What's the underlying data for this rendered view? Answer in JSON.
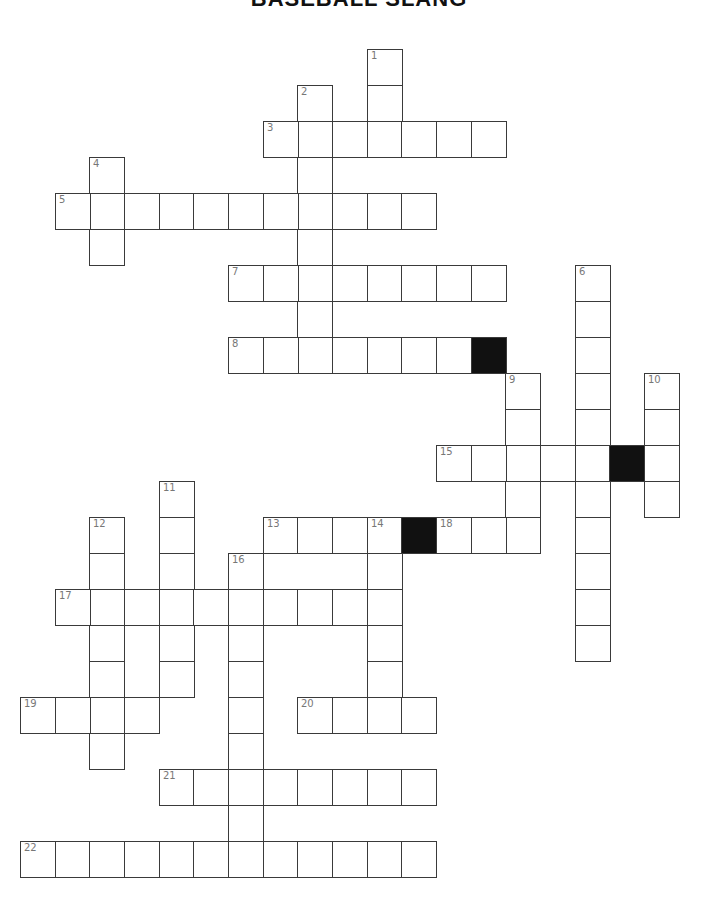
{
  "title": "BASEBALL SLANG",
  "grid": {
    "origin_x": 20,
    "origin_y": 49,
    "cell_w": 34.67,
    "cell_h": 36,
    "entries": [
      {
        "number": "1",
        "direction": "down",
        "col": 10,
        "row": 0,
        "length": 3
      },
      {
        "number": "2",
        "direction": "down",
        "col": 8,
        "row": 1,
        "length": 8
      },
      {
        "number": "3",
        "direction": "across",
        "col": 7,
        "row": 2,
        "length": 7
      },
      {
        "number": "4",
        "direction": "down",
        "col": 2,
        "row": 3,
        "length": 3
      },
      {
        "number": "5",
        "direction": "across",
        "col": 1,
        "row": 4,
        "length": 11
      },
      {
        "number": "6",
        "direction": "down",
        "col": 16,
        "row": 6,
        "length": 11
      },
      {
        "number": "7",
        "direction": "across",
        "col": 6,
        "row": 6,
        "length": 8
      },
      {
        "number": "8",
        "direction": "across",
        "col": 6,
        "row": 8,
        "length": 7
      },
      {
        "number": "9",
        "direction": "down",
        "col": 14,
        "row": 9,
        "length": 5
      },
      {
        "number": "10",
        "direction": "down",
        "col": 18,
        "row": 9,
        "length": 4
      },
      {
        "number": "11",
        "direction": "down",
        "col": 4,
        "row": 12,
        "length": 6
      },
      {
        "number": "12",
        "direction": "down",
        "col": 2,
        "row": 13,
        "length": 7
      },
      {
        "number": "13",
        "direction": "across",
        "col": 7,
        "row": 13,
        "length": 4
      },
      {
        "number": "14",
        "direction": "down",
        "col": 10,
        "row": 13,
        "length": 6
      },
      {
        "number": "15",
        "direction": "across",
        "col": 12,
        "row": 11,
        "length": 5
      },
      {
        "number": "16",
        "direction": "down",
        "col": 6,
        "row": 14,
        "length": 9
      },
      {
        "number": "17",
        "direction": "across",
        "col": 1,
        "row": 15,
        "length": 10
      },
      {
        "number": "18",
        "direction": "across",
        "col": 12,
        "row": 13,
        "length": 3
      },
      {
        "number": "19",
        "direction": "across",
        "col": 0,
        "row": 18,
        "length": 4
      },
      {
        "number": "20",
        "direction": "across",
        "col": 8,
        "row": 18,
        "length": 4
      },
      {
        "number": "21",
        "direction": "across",
        "col": 4,
        "row": 20,
        "length": 8
      },
      {
        "number": "22",
        "direction": "across",
        "col": 0,
        "row": 22,
        "length": 12
      }
    ],
    "black_cells": [
      {
        "col": 13,
        "row": 8
      },
      {
        "col": 17,
        "row": 11
      },
      {
        "col": 11,
        "row": 13
      }
    ]
  },
  "colors": {
    "line": "#3a3a3a",
    "black": "#111111",
    "number": "#777777"
  }
}
